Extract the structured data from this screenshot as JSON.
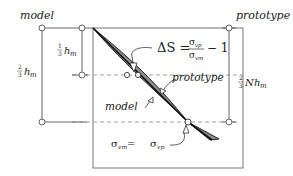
{
  "labels": {
    "model_top": "model",
    "prototype_top": "prototype",
    "model_curve": "model",
    "prototype_curve": "prototype"
  },
  "dimensions": {
    "one_third_num": "1",
    "one_third_den": "3",
    "h_m_var": "h",
    "h_m_sub": "m",
    "two_thirds_num": "2",
    "two_thirds_den": "3",
    "N": "N"
  },
  "equations": {
    "delta_s_lhs": "ΔS =",
    "delta_s_num": "σ",
    "delta_s_num_sub": "vp",
    "delta_s_den": "σ",
    "delta_s_den_sub": "vm",
    "delta_s_tail": "− 1",
    "equality_left": "σ",
    "equality_left_sub": "vm",
    "equality_mid": " = ",
    "equality_right": "σ",
    "equality_right_sub": "vp"
  },
  "colors": {
    "line": "#555555",
    "wedge_fill": "#8c8c8c",
    "wedge_stroke": "#222222",
    "dashed": "#888888",
    "box": "#777777"
  }
}
